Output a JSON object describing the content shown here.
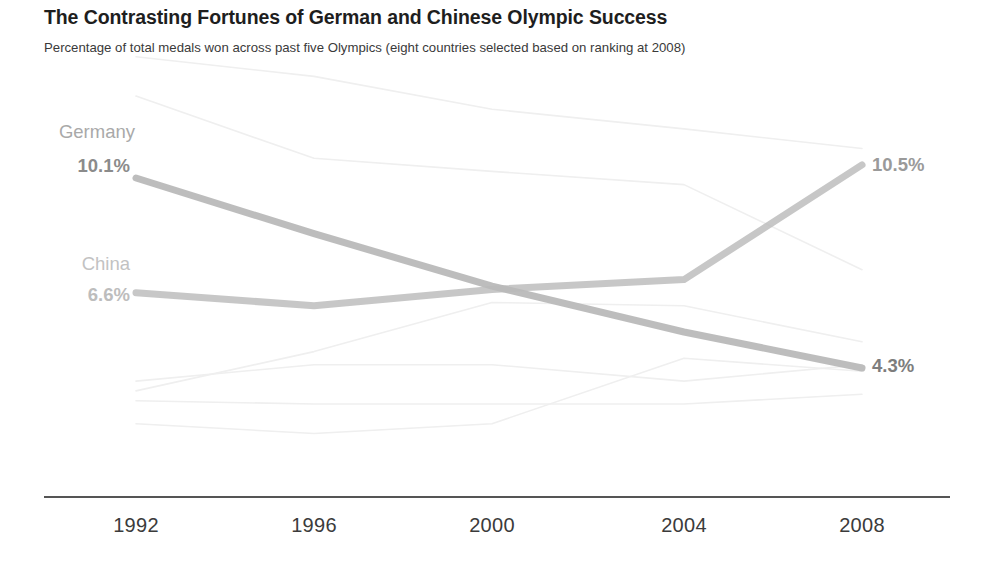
{
  "header": {
    "title": "The Contrasting Fortunes of German and Chinese Olympic Success",
    "subtitle": "Percentage of total medals won across past five Olympics (eight countries selected based on ranking at 2008)"
  },
  "labels": {
    "germany_name": "Germany",
    "germany_start_value": "10.1%",
    "germany_end_value": "4.3%",
    "china_name": "China",
    "china_start_value": "6.6%",
    "china_end_value": "10.5%"
  },
  "axis": {
    "ticks": [
      "1992",
      "1996",
      "2000",
      "2004",
      "2008"
    ]
  },
  "colors": {
    "highlight_dark": "#b9b9b9",
    "highlight_mid": "#c9c9c9",
    "background_line": "#efefef",
    "axis": "#555555",
    "title": "#1e1e1e"
  },
  "chart_data": {
    "type": "line",
    "title": "The Contrasting Fortunes of German and Chinese Olympic Success",
    "subtitle": "Percentage of total medals won across past five Olympics (eight countries selected based on ranking at 2008)",
    "xlabel": "",
    "ylabel": "Percentage of total medals won",
    "x": [
      1992,
      1996,
      2000,
      2004,
      2008
    ],
    "xtick_labels": [
      "1992",
      "1996",
      "2000",
      "2004",
      "2008"
    ],
    "ylim": [
      0.0,
      15.5
    ],
    "grid": false,
    "legend": "inline-labels",
    "highlighted": [
      "Germany",
      "China"
    ],
    "series": [
      {
        "name": "United States",
        "highlight": false,
        "values": [
          13.8,
          13.2,
          12.2,
          11.6,
          11.0
        ]
      },
      {
        "name": "Germany",
        "highlight": true,
        "values": [
          10.1,
          8.4,
          6.8,
          5.4,
          4.3
        ]
      },
      {
        "name": "China",
        "highlight": true,
        "values": [
          6.6,
          6.2,
          6.7,
          7.0,
          10.5
        ]
      },
      {
        "name": "Russia",
        "highlight": false,
        "values": [
          12.6,
          10.7,
          10.3,
          9.9,
          7.3
        ]
      },
      {
        "name": "Australia",
        "highlight": false,
        "values": [
          3.6,
          4.8,
          6.3,
          6.2,
          5.1
        ]
      },
      {
        "name": "Japan",
        "highlight": false,
        "values": [
          2.6,
          2.3,
          2.6,
          4.6,
          4.2
        ]
      },
      {
        "name": "France",
        "highlight": false,
        "values": [
          3.9,
          4.4,
          4.4,
          3.9,
          4.4
        ]
      },
      {
        "name": "South Korea",
        "highlight": false,
        "values": [
          3.3,
          3.2,
          3.2,
          3.2,
          3.5
        ]
      }
    ]
  }
}
